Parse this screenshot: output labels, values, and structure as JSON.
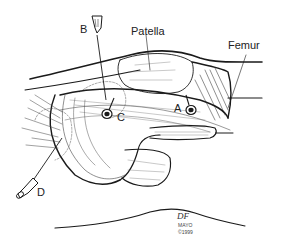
{
  "figure": {
    "type": "anatomical line illustration",
    "labels": {
      "patella": "Patella",
      "femur": "Femur",
      "a": "A",
      "b": "B",
      "c": "C",
      "d": "D"
    },
    "signature": {
      "initials": "DF",
      "org": "MAYO",
      "copyright": "©1999"
    },
    "colors": {
      "ink": "#1a1a1a",
      "background": "#ffffff"
    }
  }
}
